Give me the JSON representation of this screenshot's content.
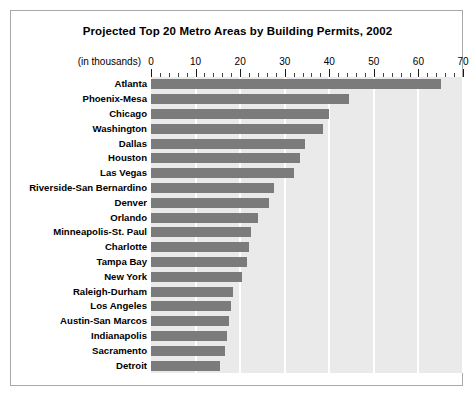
{
  "chart_data": {
    "type": "bar",
    "orientation": "horizontal",
    "title": "Projected Top 20 Metro Areas by Building Permits, 2002",
    "units_note": "(in thousands)",
    "xlabel": "",
    "ylabel": "",
    "xlim": [
      0,
      70
    ],
    "xticks": [
      0,
      10,
      20,
      30,
      40,
      50,
      60,
      70
    ],
    "xtick_labels": [
      "0",
      "10",
      "20",
      "30",
      "40",
      "50",
      "60",
      "70"
    ],
    "minor_tick_interval": 2,
    "grid": true,
    "grid_orientation": "vertical",
    "legend": null,
    "categories": [
      "Atlanta",
      "Phoenix-Mesa",
      "Chicago",
      "Washington",
      "Dallas",
      "Houston",
      "Las Vegas",
      "Riverside-San Bernardino",
      "Denver",
      "Orlando",
      "Minneapolis-St. Paul",
      "Charlotte",
      "Tampa Bay",
      "New York",
      "Raleigh-Durham",
      "Los Angeles",
      "Austin-San Marcos",
      "Indianapolis",
      "Sacramento",
      "Detroit"
    ],
    "values": [
      65,
      44.5,
      40,
      38.5,
      34.5,
      33.5,
      32,
      27.5,
      26.5,
      24,
      22.5,
      22,
      21.5,
      20.5,
      18.5,
      18,
      17.5,
      17,
      16.5,
      15.5
    ]
  },
  "colors": {
    "bar": "#7b7b7b",
    "plot_background": "#eaeaea",
    "gridline": "#ffffff",
    "frame_border": "#a8a8a8",
    "text": "#000000",
    "page_background": "#ffffff"
  }
}
